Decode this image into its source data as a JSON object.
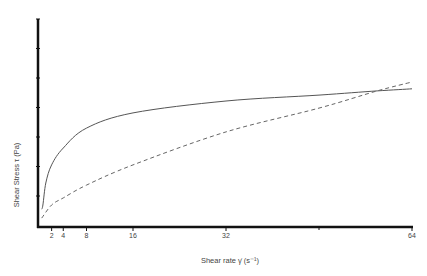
{
  "chart_data": {
    "type": "line",
    "title": "",
    "xlabel": "Shear rate γ̇ (s⁻¹)",
    "ylabel": "Shear Stress τ (Pa)",
    "x_ticks": [
      2,
      4,
      8,
      16,
      32,
      64
    ],
    "x_tick_labels": [
      "2",
      "4",
      "8",
      "16",
      "32",
      "64"
    ],
    "y_tick_count": 7,
    "y_tick_labels": [],
    "xlim": [
      0,
      64
    ],
    "ylim": [
      0,
      7
    ],
    "grid": false,
    "legend": null,
    "series": [
      {
        "name": "solid curve (shear-thinning)",
        "style": "solid",
        "x": [
          0.3,
          0.5,
          1,
          2,
          4,
          8,
          16,
          32,
          48,
          58,
          64
        ],
        "y": [
          0.6,
          0.74,
          1.48,
          2.09,
          2.66,
          3.33,
          3.84,
          4.24,
          4.44,
          4.58,
          4.65
        ]
      },
      {
        "name": "dashed curve",
        "style": "dashed",
        "x": [
          0.3,
          2,
          4,
          8,
          16,
          32,
          48,
          58,
          64
        ],
        "y": [
          0.3,
          0.74,
          0.98,
          1.41,
          2.09,
          3.2,
          4.0,
          4.58,
          4.88
        ]
      }
    ]
  },
  "labels": {
    "xlabel": "Shear rate γ̇ (s⁻¹)",
    "ylabel": "Shear Stress τ (Pa)",
    "x_ticks": [
      "2",
      "4",
      "8",
      "16",
      "32",
      "64"
    ]
  }
}
